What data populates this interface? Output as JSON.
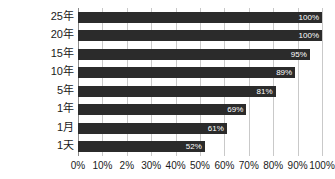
{
  "chart_data": {
    "type": "bar",
    "orientation": "horizontal",
    "title": "",
    "subtitle": "",
    "xlabel": "",
    "ylabel": "",
    "xlim": [
      0,
      100
    ],
    "grid": true,
    "legend": false,
    "legend_position": "none",
    "categories": [
      "25年",
      "20年",
      "15年",
      "10年",
      "5年",
      "1年",
      "1月",
      "1天"
    ],
    "values": [
      100,
      100,
      95,
      89,
      81,
      69,
      61,
      52
    ],
    "value_labels": [
      "100%",
      "100%",
      "95%",
      "89%",
      "81%",
      "69%",
      "61%",
      "52%"
    ],
    "xticks": [
      0,
      10,
      20,
      30,
      40,
      50,
      60,
      70,
      80,
      90,
      100
    ],
    "xtick_labels": [
      "0%",
      "10%",
      "2%",
      "30%",
      "40%",
      "50%",
      "60%",
      "70%",
      "80%",
      "90%",
      "100%"
    ],
    "colors": {
      "bar": "#2b2b2b",
      "value_label": "#ffffff",
      "gridline": "#c9c9c9",
      "axis": "#8a8a8a",
      "text": "#1a1a1a",
      "background": "#ffffff"
    }
  }
}
